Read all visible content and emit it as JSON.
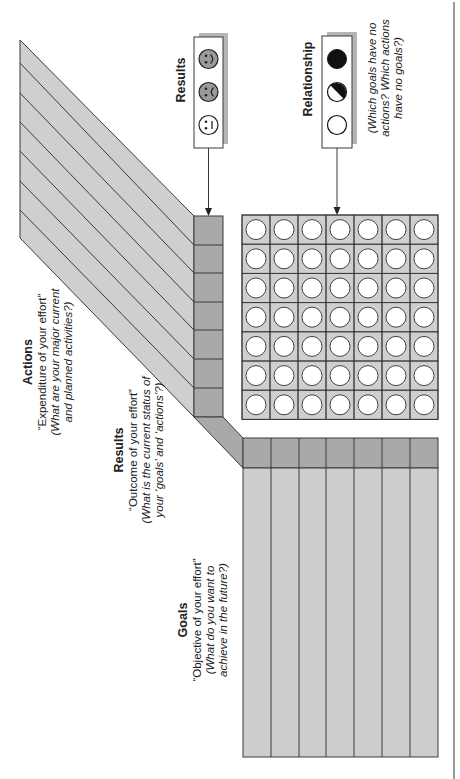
{
  "diagram": {
    "sections": {
      "actions": {
        "title": "Actions",
        "subtitle": "“Expenditure of your effort”",
        "question_line1": "(What are your major current",
        "question_line2": "and planned activities?)",
        "row_count": 7
      },
      "results": {
        "title": "Results",
        "subtitle": "“Outcome of your effort”",
        "question_line1": "(What is the current status of",
        "question_line2": "your ‘goals’ and ‘actions’?)"
      },
      "goals": {
        "title": "Goals",
        "subtitle": "“Objective of your effort”",
        "question_line1": "(What do you want to",
        "question_line2": "achieve in the future?)",
        "column_count": 7
      }
    },
    "legends": {
      "results": {
        "title": "Results",
        "icons": [
          "neutral-face-icon",
          "sad-face-icon",
          "happy-face-icon"
        ]
      },
      "relationship": {
        "title": "Relationship",
        "icons": [
          "empty-circle-icon",
          "half-filled-circle-icon",
          "filled-circle-icon"
        ],
        "question_line1": "(Which goals have no",
        "question_line2": "actions? Which actions",
        "question_line3": "have no goals?)"
      }
    },
    "matrix": {
      "rows": 7,
      "columns": 7,
      "cell_state": "empty-circle"
    },
    "colors": {
      "stripe_fill": "#cfcfcf",
      "header_fill": "#a9a9a9",
      "goal_fill": "#cdcdcd",
      "matrix_fill": "#cfcfcf",
      "line": "#3a3a3a",
      "legend_shadow": "#b5b5b5"
    }
  }
}
